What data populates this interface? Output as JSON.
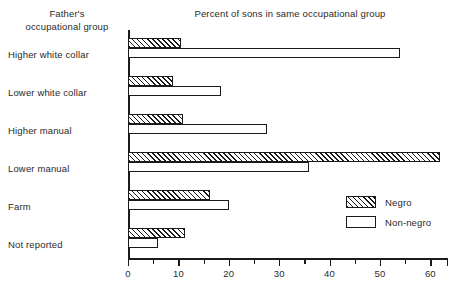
{
  "headers": {
    "left_line1": "Father's",
    "left_line2": "occupational group",
    "title": "Percent of sons in same occupational group"
  },
  "legend": {
    "items": [
      {
        "label": "Negro",
        "pattern": "hatched"
      },
      {
        "label": "Non-negro",
        "pattern": "open"
      }
    ]
  },
  "axis": {
    "tick_labels": [
      "0",
      "10",
      "20",
      "30",
      "40",
      "50",
      "60"
    ],
    "tick_values": [
      0,
      10,
      20,
      30,
      40,
      50,
      60
    ],
    "minor_step": 5,
    "max": 63.5
  },
  "chart_data": {
    "type": "bar",
    "orientation": "horizontal",
    "title": "Percent of sons in same occupational group",
    "xlabel": "",
    "ylabel": "Father's occupational group",
    "xlim": [
      0,
      63.5
    ],
    "grid": false,
    "legend_position": "lower-right",
    "categories": [
      "Higher white collar",
      "Lower white collar",
      "Higher manual",
      "Lower manual",
      "Farm",
      "Not reported"
    ],
    "series": [
      {
        "name": "Negro",
        "values": [
          10.5,
          9.0,
          11.0,
          62.0,
          16.3,
          11.3
        ]
      },
      {
        "name": "Non-negro",
        "values": [
          54.0,
          18.5,
          27.5,
          36.0,
          20.0,
          6.0
        ]
      }
    ]
  }
}
